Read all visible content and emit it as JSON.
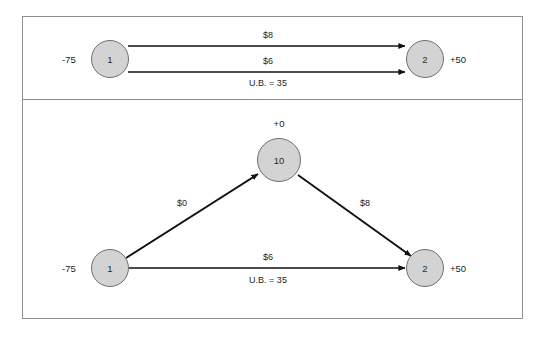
{
  "figure": {
    "type": "network-flow-diagram",
    "panels": [
      {
        "id": "panel-top",
        "name": "original-network",
        "nodes": [
          {
            "id": "n1",
            "label": "1",
            "supply_label": "-75",
            "supply_side": "left"
          },
          {
            "id": "n2",
            "label": "2",
            "supply_label": "+50",
            "supply_side": "right"
          }
        ],
        "edges": [
          {
            "id": "e1",
            "from": "1",
            "to": "2",
            "cost_label": "$8",
            "bound_label": ""
          },
          {
            "id": "e2",
            "from": "1",
            "to": "2",
            "cost_label": "$6",
            "bound_label": "U.B. = 35"
          }
        ]
      },
      {
        "id": "panel-bottom",
        "name": "transformed-network",
        "nodes": [
          {
            "id": "n1b",
            "label": "1",
            "supply_label": "-75",
            "supply_side": "left"
          },
          {
            "id": "n10",
            "label": "10",
            "supply_label": "+0",
            "supply_side": "top"
          },
          {
            "id": "n2b",
            "label": "2",
            "supply_label": "+50",
            "supply_side": "right"
          }
        ],
        "edges": [
          {
            "id": "e3",
            "from": "1",
            "to": "10",
            "cost_label": "$0",
            "bound_label": ""
          },
          {
            "id": "e4",
            "from": "10",
            "to": "2",
            "cost_label": "$8",
            "bound_label": ""
          },
          {
            "id": "e5",
            "from": "1",
            "to": "2",
            "cost_label": "$6",
            "bound_label": "U.B. = 35"
          }
        ]
      }
    ]
  },
  "colors": {
    "node_fill": "#d3d3d3",
    "node_stroke": "#6d6f72",
    "edge_stroke": "#111111",
    "frame_stroke": "#8e9094",
    "text": "#1d1d1d",
    "background": "#ffffff"
  }
}
